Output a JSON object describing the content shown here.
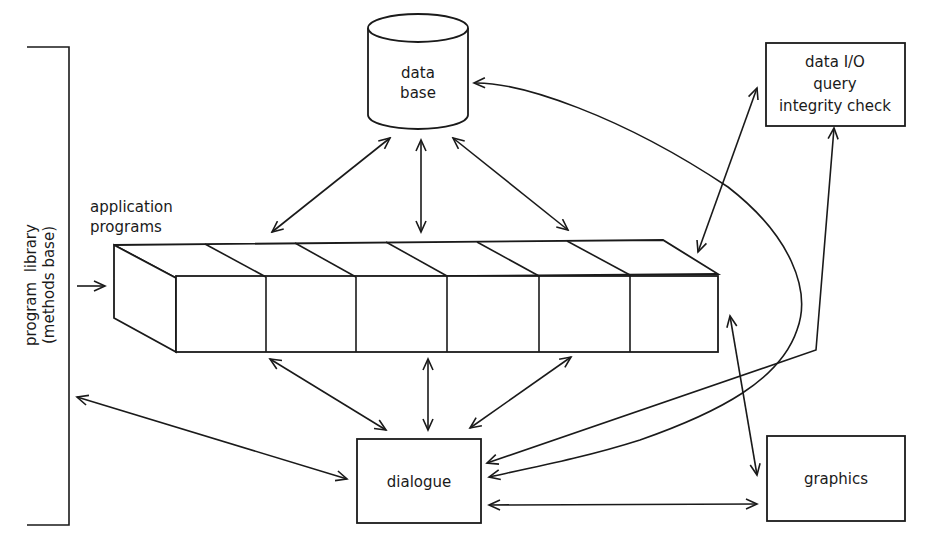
{
  "diagram": {
    "type": "system-architecture",
    "nodes": {
      "database": {
        "line1": "data",
        "line2": "base",
        "shape": "cylinder"
      },
      "data_io": {
        "line1": "data I/O",
        "line2": "query",
        "line3": "integrity check",
        "shape": "rectangle"
      },
      "application_programs": {
        "line1": "application",
        "line2": "programs",
        "shape": "segmented-3d-bar",
        "segments": 6
      },
      "program_library": {
        "line1": "program  library",
        "line2": "(methods base)",
        "shape": "bracket"
      },
      "dialogue": {
        "label": "dialogue",
        "shape": "rectangle"
      },
      "graphics": {
        "label": "graphics",
        "shape": "rectangle"
      }
    },
    "edges": [
      {
        "from": "database",
        "to": "application_programs",
        "direction": "both",
        "count": 3
      },
      {
        "from": "application_programs",
        "to": "dialogue",
        "direction": "both",
        "count": 3
      },
      {
        "from": "program_library",
        "to": "application_programs",
        "direction": "forward"
      },
      {
        "from": "program_library",
        "to": "dialogue",
        "direction": "both"
      },
      {
        "from": "data_io",
        "to": "application_programs",
        "direction": "both"
      },
      {
        "from": "data_io",
        "to": "dialogue",
        "direction": "both"
      },
      {
        "from": "dialogue",
        "to": "database",
        "direction": "both",
        "style": "curved"
      },
      {
        "from": "application_programs",
        "to": "graphics",
        "direction": "both"
      },
      {
        "from": "dialogue",
        "to": "graphics",
        "direction": "both"
      }
    ]
  }
}
